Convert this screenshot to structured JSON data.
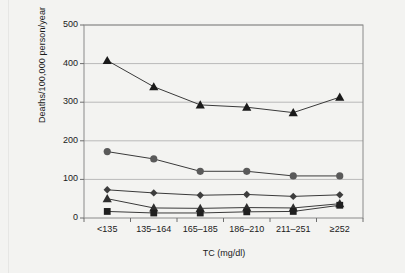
{
  "figure": {
    "background_color": "#f3f3f1",
    "frame_color": "#8a8a8a",
    "grid_color": "#b9b9b9"
  },
  "chart_data": {
    "type": "line",
    "title": "",
    "xlabel": "TC (mg/dl)",
    "ylabel": "Deaths/100,000 person/year",
    "categories": [
      "<135",
      "135–164",
      "165–185",
      "186–210",
      "211–251",
      "≥252"
    ],
    "ylim": [
      0,
      500
    ],
    "yticks": [
      0,
      100,
      200,
      300,
      400,
      500
    ],
    "grid": "horizontal",
    "legend_position": "top-inside",
    "series": [
      {
        "name": "All-cause",
        "marker": "triangle",
        "color": "#1a1a1a",
        "values": [
          408,
          340,
          293,
          287,
          273,
          313
        ]
      },
      {
        "name": "Cancer",
        "marker": "circle",
        "color": "#5a5a5a",
        "values": [
          172,
          153,
          121,
          121,
          109,
          109
        ]
      },
      {
        "name": "Violent cause",
        "marker": "diamond",
        "color": "#3d3d3d",
        "values": [
          73,
          65,
          59,
          61,
          56,
          60
        ]
      },
      {
        "name": "Stroke",
        "marker": "triangle",
        "color": "#2e2e2e",
        "values": [
          50,
          26,
          25,
          27,
          26,
          37
        ]
      },
      {
        "name": "CHD",
        "marker": "square",
        "color": "#1f1f1f",
        "values": [
          17,
          13,
          13,
          16,
          17,
          33
        ]
      }
    ]
  },
  "legend": {
    "row1": [
      {
        "label": "All-cause",
        "marker": "triangle"
      },
      {
        "label": "Cancer",
        "marker": "circle"
      },
      {
        "label": "Violent cause",
        "marker": "diamond"
      },
      {
        "label": "Stroke",
        "marker": "triangle"
      }
    ],
    "row2": [
      {
        "label": "CHD",
        "marker": "square"
      }
    ]
  }
}
